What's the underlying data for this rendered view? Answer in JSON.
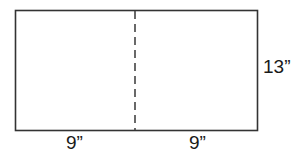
{
  "diagram": {
    "colors": {
      "stroke": "#333333",
      "background": "#ffffff",
      "text": "#1a1a1a"
    },
    "rectangle": {
      "x": 15,
      "y": 10,
      "width": 242,
      "height": 120
    },
    "fold_line": {
      "x": 135,
      "style": "dashed"
    },
    "labels": {
      "height": "13”",
      "left_width": "9”",
      "right_width": "9”"
    }
  }
}
